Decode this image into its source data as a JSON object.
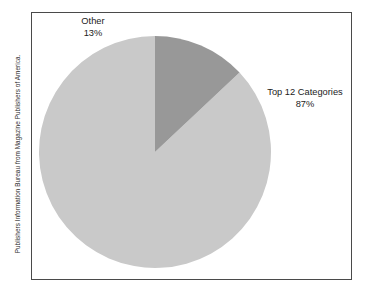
{
  "figure": {
    "source_credit": "Publishers Information Bureau from Magazine Publishers of America.",
    "frame_color": "#4a4a4a",
    "background_color": "#ffffff"
  },
  "chart_data": {
    "type": "pie",
    "title": "",
    "subtitle": "",
    "xlabel": "",
    "ylabel": "",
    "legend_position": "none",
    "grid": false,
    "labels_shown": "outside",
    "start_angle_deg": 90,
    "direction": "counterclockwise",
    "units": "percent",
    "categories": [
      "Top 12 Categories",
      "Other"
    ],
    "values": [
      87,
      13
    ],
    "slices": [
      {
        "label": "Top 12 Categories",
        "value": 87,
        "value_text": "87%",
        "color": "#c9c9c9",
        "start_deg": 90,
        "sweep_deg": 313.2
      },
      {
        "label": "Other",
        "value": 13,
        "value_text": "13%",
        "color": "#989898",
        "start_deg": 43.2,
        "sweep_deg": 46.8
      }
    ],
    "annotations": [
      "Publishers Information Bureau from Magazine Publishers of America."
    ]
  },
  "geometry": {
    "center_x": 124,
    "center_y": 140,
    "radius": 116
  }
}
